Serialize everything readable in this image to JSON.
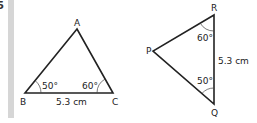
{
  "question_number": "5",
  "triangle_abc": {
    "vertices": {
      "A": "A",
      "B": "B",
      "C": "C"
    },
    "angle_b": "50°",
    "angle_c": "60°",
    "side_bc": "5.3 cm"
  },
  "triangle_pqr": {
    "vertices": {
      "P": "P",
      "Q": "Q",
      "R": "R"
    },
    "angle_r": "60°",
    "angle_q": "50°",
    "side_qr": "5.3 cm"
  },
  "colors": {
    "line": "#222222",
    "bar": "#d6d6d6"
  }
}
